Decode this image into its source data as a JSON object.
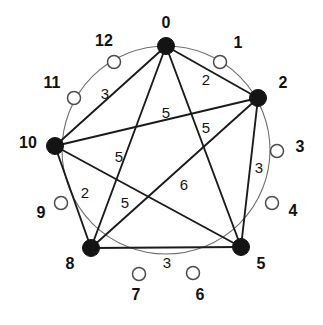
{
  "diagram": {
    "type": "circulant-graph",
    "title": "",
    "geometry": {
      "center_x": 166,
      "center_y": 150,
      "radius": 104,
      "modulus": 13,
      "start_angle_deg": -90,
      "direction": "clockwise"
    },
    "colors": {
      "filled_node": "#141414",
      "open_node_fill": "#ffffff",
      "open_node_stroke": "#4d4d4d",
      "chord": "#1b1b1b",
      "ring": "#6f6f6f",
      "text": "#111111",
      "background": "#ffffff"
    },
    "nodes": [
      {
        "id": "0",
        "label": "0",
        "state": "filled",
        "cx": 166,
        "cy": 46,
        "r": 8.5,
        "lx": 166,
        "ly": 24
      },
      {
        "id": "1",
        "label": "1",
        "state": "open",
        "cx": 220,
        "cy": 62,
        "r": 6.5,
        "lx": 238,
        "ly": 44
      },
      {
        "id": "2",
        "label": "2",
        "state": "filled",
        "cx": 258,
        "cy": 98,
        "r": 8.5,
        "lx": 283,
        "ly": 84
      },
      {
        "id": "3",
        "label": "3",
        "state": "open",
        "cx": 277,
        "cy": 151,
        "r": 6.5,
        "lx": 300,
        "ly": 148
      },
      {
        "id": "4",
        "label": "4",
        "state": "open",
        "cx": 272,
        "cy": 203,
        "r": 6.5,
        "lx": 293,
        "ly": 212
      },
      {
        "id": "5",
        "label": "5",
        "state": "filled",
        "cx": 241,
        "cy": 247,
        "r": 8.5,
        "lx": 261,
        "ly": 265
      },
      {
        "id": "6",
        "label": "6",
        "state": "open",
        "cx": 193,
        "cy": 273,
        "r": 6.5,
        "lx": 200,
        "ly": 296
      },
      {
        "id": "7",
        "label": "7",
        "state": "open",
        "cx": 139,
        "cy": 274,
        "r": 6.5,
        "lx": 136,
        "ly": 296
      },
      {
        "id": "8",
        "label": "8",
        "state": "filled",
        "cx": 91,
        "cy": 248,
        "r": 8.5,
        "lx": 70,
        "ly": 265
      },
      {
        "id": "9",
        "label": "9",
        "state": "open",
        "cx": 61,
        "cy": 203,
        "r": 6.5,
        "lx": 41,
        "ly": 214
      },
      {
        "id": "10",
        "label": "10",
        "state": "filled",
        "cx": 55,
        "cy": 146,
        "r": 8.5,
        "lx": 28,
        "ly": 144
      },
      {
        "id": "11",
        "label": "11",
        "state": "open",
        "cx": 74,
        "cy": 98,
        "r": 6.5,
        "lx": 52,
        "ly": 84
      },
      {
        "id": "12",
        "label": "12",
        "state": "open",
        "cx": 114,
        "cy": 62,
        "r": 6.5,
        "lx": 104,
        "ly": 42
      }
    ],
    "edges": [
      {
        "from": "0",
        "to": "2",
        "weight": "2",
        "lx": 206,
        "ly": 81
      },
      {
        "from": "2",
        "to": "5",
        "weight": "3",
        "lx": 259,
        "ly": 169
      },
      {
        "from": "5",
        "to": "8",
        "weight": "3",
        "lx": 167,
        "ly": 264
      },
      {
        "from": "8",
        "to": "10",
        "weight": "2",
        "lx": 85,
        "ly": 194
      },
      {
        "from": "10",
        "to": "0",
        "weight": "3",
        "lx": 105,
        "ly": 95
      },
      {
        "from": "0",
        "to": "5",
        "weight": "5",
        "lx": 206,
        "ly": 129
      },
      {
        "from": "0",
        "to": "8",
        "weight": "5",
        "lx": 119,
        "ly": 158
      },
      {
        "from": "2",
        "to": "10",
        "weight": "5",
        "lx": 166,
        "ly": 114
      },
      {
        "from": "2",
        "to": "8",
        "weight": "6",
        "lx": 184,
        "ly": 186
      },
      {
        "from": "5",
        "to": "10",
        "weight": "5",
        "lx": 125,
        "ly": 204
      }
    ],
    "edge_labels": [
      "2",
      "3",
      "3",
      "2",
      "3",
      "5",
      "5",
      "5",
      "6",
      "5"
    ],
    "node_labels": [
      "0",
      "1",
      "2",
      "3",
      "4",
      "5",
      "6",
      "7",
      "8",
      "9",
      "10",
      "11",
      "12"
    ],
    "filled_nodes": [
      "0",
      "2",
      "5",
      "8",
      "10"
    ],
    "open_nodes": [
      "1",
      "3",
      "4",
      "6",
      "7",
      "9",
      "11",
      "12"
    ]
  }
}
